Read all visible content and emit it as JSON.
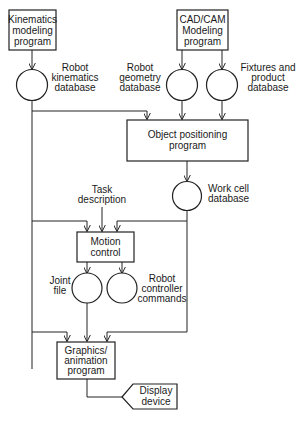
{
  "diagram": {
    "nodes": {
      "kinematics_program": {
        "type": "process",
        "lines": [
          "Kinematics",
          "modeling",
          "program"
        ]
      },
      "cadcam_program": {
        "type": "process",
        "lines": [
          "CAD/CAM",
          "Modeling",
          "program"
        ]
      },
      "robot_kinematics_db": {
        "type": "data-store",
        "lines": [
          "Robot",
          "kinematics",
          "database"
        ]
      },
      "robot_geometry_db": {
        "type": "data-store",
        "lines": [
          "Robot",
          "geometry",
          "database"
        ]
      },
      "fixtures_db": {
        "type": "data-store",
        "lines": [
          "Fixtures and",
          "product",
          "database"
        ]
      },
      "object_positioning": {
        "type": "process",
        "lines": [
          "Object positioning",
          "program"
        ]
      },
      "work_cell_db": {
        "type": "data-store",
        "lines": [
          "Work cell",
          "database"
        ]
      },
      "task_description": {
        "type": "input",
        "lines": [
          "Task",
          "description"
        ]
      },
      "motion_control": {
        "type": "process",
        "lines": [
          "Motion",
          "control"
        ]
      },
      "joint_file": {
        "type": "data-store",
        "lines": [
          "Joint",
          "file"
        ]
      },
      "robot_controller_cmds": {
        "type": "data-store",
        "lines": [
          "Robot",
          "controller",
          "commands"
        ]
      },
      "graphics_program": {
        "type": "process",
        "lines": [
          "Graphics/",
          "animation",
          "program"
        ]
      },
      "display_device": {
        "type": "output",
        "lines": [
          "Display",
          "device"
        ]
      }
    },
    "edges": [
      [
        "kinematics_program",
        "robot_kinematics_db"
      ],
      [
        "cadcam_program",
        "robot_geometry_db"
      ],
      [
        "cadcam_program",
        "fixtures_db"
      ],
      [
        "robot_kinematics_db",
        "object_positioning"
      ],
      [
        "robot_geometry_db",
        "object_positioning"
      ],
      [
        "fixtures_db",
        "object_positioning"
      ],
      [
        "object_positioning",
        "work_cell_db"
      ],
      [
        "robot_kinematics_db",
        "motion_control"
      ],
      [
        "task_description",
        "motion_control"
      ],
      [
        "work_cell_db",
        "motion_control"
      ],
      [
        "motion_control",
        "joint_file"
      ],
      [
        "motion_control",
        "robot_controller_cmds"
      ],
      [
        "robot_kinematics_db",
        "graphics_program"
      ],
      [
        "joint_file",
        "graphics_program"
      ],
      [
        "work_cell_db",
        "graphics_program"
      ],
      [
        "graphics_program",
        "display_device"
      ]
    ]
  }
}
